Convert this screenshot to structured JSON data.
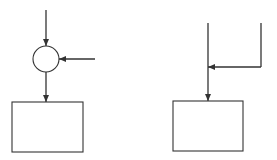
{
  "diagram": {
    "background": "#ffffff",
    "stroke_color": "#333333",
    "left": {
      "description": "Two inputs merging at a summing junction (circle) feeding a block",
      "top_input": {
        "x1": 46,
        "y1": 10,
        "x2": 46,
        "y2": 46
      },
      "junction_circle": {
        "cx": 46,
        "cy": 59,
        "r": 13
      },
      "side_input": {
        "x1": 95,
        "y1": 59,
        "x2": 59,
        "y2": 59
      },
      "output_line": {
        "x1": 46,
        "y1": 72,
        "x2": 46,
        "y2": 102
      },
      "block": {
        "x": 12,
        "y": 102,
        "width": 71,
        "height": 50
      }
    },
    "right": {
      "description": "Two inputs joining at a takeoff point on a line feeding a block",
      "main_input": {
        "x1": 208,
        "y1": 23,
        "x2": 208,
        "y2": 101
      },
      "side_input_vertical": {
        "x1": 261,
        "y1": 23,
        "x2": 261,
        "y2": 67
      },
      "side_input_horizontal": {
        "x1": 261,
        "y1": 67,
        "x2": 208,
        "y2": 67
      },
      "block": {
        "x": 173,
        "y": 101,
        "width": 70,
        "height": 50
      }
    }
  }
}
